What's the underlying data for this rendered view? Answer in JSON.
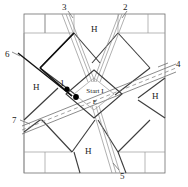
{
  "figure": {
    "type": "floor-plan-diagram",
    "stroke_color": "#3c3c3c",
    "light_stroke_color": "#9a9a9a",
    "accent_color": "#000000",
    "background": "#ffffff",
    "width": 188,
    "height": 187
  },
  "center": {
    "line1": "Start I",
    "line2": "E"
  },
  "callouts": [
    {
      "id": "callout-1",
      "label": "1",
      "x": 60,
      "y": 79
    },
    {
      "id": "callout-2",
      "label": "2",
      "x": 123,
      "y": 3
    },
    {
      "id": "callout-3",
      "label": "3",
      "x": 62,
      "y": 3
    },
    {
      "id": "callout-4",
      "label": "4",
      "x": 176,
      "y": 60
    },
    {
      "id": "callout-5",
      "label": "5",
      "x": 120,
      "y": 172
    },
    {
      "id": "callout-6",
      "label": "6",
      "x": 5,
      "y": 50
    },
    {
      "id": "callout-7",
      "label": "7",
      "x": 12,
      "y": 116
    }
  ],
  "halls": [
    {
      "id": "hall-top",
      "label": "H",
      "x": 91,
      "y": 25
    },
    {
      "id": "hall-left",
      "label": "H",
      "x": 33,
      "y": 83
    },
    {
      "id": "hall-right",
      "label": "H",
      "x": 152,
      "y": 92
    },
    {
      "id": "hall-bottom",
      "label": "H",
      "x": 85,
      "y": 147
    }
  ]
}
